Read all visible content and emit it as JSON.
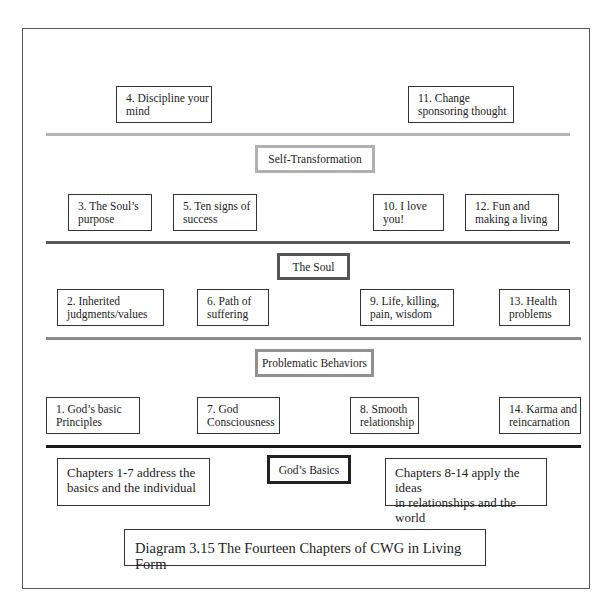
{
  "diagram": {
    "caption": "Diagram 3.15 The Fourteen Chapters of CWG in Living Form",
    "levels": [
      {
        "label": "Self-Transformation",
        "chapters_above": [
          {
            "line1": "4. Discipline your",
            "line2": "mind"
          },
          {
            "line1": "11. Change",
            "line2": "sponsoring thought"
          }
        ]
      },
      {
        "label": "The Soul",
        "chapters_above": [
          {
            "line1": "3. The Soul’s",
            "line2": "purpose"
          },
          {
            "line1": "5. Ten signs of",
            "line2": "success"
          },
          {
            "line1": "10. I love",
            "line2": "you!"
          },
          {
            "line1": "12. Fun and",
            "line2": "making a living"
          }
        ]
      },
      {
        "label": "Problematic Behaviors",
        "chapters_above": [
          {
            "line1": "2.  Inherited",
            "line2": "judgments/values"
          },
          {
            "line1": "6. Path of",
            "line2": "suffering"
          },
          {
            "line1": "9. Life, killing,",
            "line2": "pain, wisdom"
          },
          {
            "line1": "13. Health",
            "line2": "problems"
          }
        ]
      },
      {
        "label": "God’s Basics",
        "chapters_above": [
          {
            "line1": "1. God’s basic",
            "line2": "Principles"
          },
          {
            "line1": "7. God",
            "line2": "Consciousness"
          },
          {
            "line1": "8. Smooth",
            "line2": "relationship"
          },
          {
            "line1": "14. Karma and",
            "line2": "reincarnation"
          }
        ]
      }
    ],
    "notes": {
      "left": {
        "line1": "Chapters 1-7 address the",
        "line2": "basics and the individual"
      },
      "right": {
        "line1": "Chapters 8-14 apply the ideas",
        "line2": "in relationships and the world"
      }
    },
    "colors": {
      "line_self_transformation": "#b4b4b4",
      "line_soul": "#595959",
      "line_problematic": "#8c8c8c",
      "line_gods_basics": "#1a1a1a"
    }
  }
}
